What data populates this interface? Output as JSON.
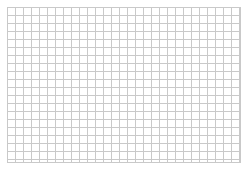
{
  "page": {
    "background_color": "#ffffff",
    "width": 248,
    "height": 170
  },
  "grid": {
    "name": "graph-paper-grid",
    "line_color": "#c9c9c9",
    "line_width_px": 1,
    "cell_width_px": 8,
    "cell_height_px": 8,
    "columns": 29,
    "rows": 19,
    "origin_x_px": 7,
    "origin_y_px": 7,
    "area_width_px": 234,
    "area_height_px": 156,
    "border_color": "#c9c9c9",
    "fill_color": "#ffffff",
    "margin_top_px": 7,
    "margin_left_px": 7,
    "margin_right_px": 7,
    "margin_bottom_px": 7,
    "subdivisions": 0
  }
}
